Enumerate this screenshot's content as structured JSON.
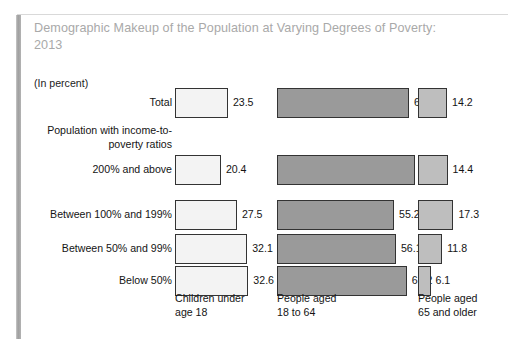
{
  "figure": {
    "title": "Demographic Makeup of the Population at Varying Degrees of Poverty: 2013",
    "units_note": "(In percent)",
    "group_heading": "Population with income-to-poverty ratios",
    "title_color": "#a9a9a9",
    "text_color": "#141414"
  },
  "chart_data": {
    "type": "bar",
    "orientation": "horizontal",
    "title": "Demographic Makeup of the Population at Varying Degrees of Poverty: 2013",
    "subtitle": "(In percent)",
    "xlabel": "",
    "ylabel": "",
    "grid": false,
    "legend_position": "below-axis-as-category-labels",
    "group_heading": "Population with income-to-poverty ratios",
    "categories": [
      "Total",
      "200% and above",
      "Between 100% and 199%",
      "Between 50% and 99%",
      "Below 50%"
    ],
    "series": [
      {
        "name": "Children under age 18",
        "color": "#f3f3f3",
        "values": [
          23.5,
          20.4,
          27.5,
          32.1,
          32.6
        ]
      },
      {
        "name": "People aged 18 to 64",
        "color": "#9a9a9a",
        "values": [
          62.3,
          65.2,
          55.2,
          56.1,
          61.2
        ]
      },
      {
        "name": "People aged 65 and older",
        "color": "#bebebe",
        "values": [
          14.2,
          14.4,
          17.3,
          11.8,
          6.1
        ]
      }
    ],
    "column_labels": [
      "Children under age 18",
      "People aged 18 to 64",
      "People aged 65 and older"
    ],
    "column_labels_wrapped": [
      [
        "Children under",
        "age 18"
      ],
      [
        "People aged",
        "18 to 64"
      ],
      [
        "People aged",
        "65 and older"
      ]
    ]
  },
  "layout": {
    "row_tops": [
      88,
      155,
      200,
      234,
      266
    ],
    "bar_height": 30,
    "columns": [
      {
        "left": 175,
        "scale": 2.25
      },
      {
        "left": 277,
        "scale": 2.12
      },
      {
        "left": 418,
        "scale": 2.05
      }
    ],
    "category_label_tops": [
      292,
      292,
      292
    ],
    "category_label_lefts": [
      175,
      277,
      418
    ]
  }
}
